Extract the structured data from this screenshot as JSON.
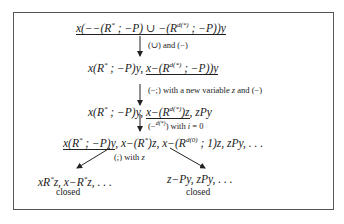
{
  "diagram": {
    "type": "tableau-derivation",
    "nodes": [
      {
        "id": "n1",
        "text": "x(−−(R* ; −P) ∪ −(R^d(*) ; −P))y",
        "underlined": "all"
      },
      {
        "id": "n2",
        "text": "x(R* ; −P)y, x−(R^d(*) ; −P))y",
        "underlined": "x−(R^d(*) ; −P))y"
      },
      {
        "id": "n3",
        "text": "x(R* ; −P)y, x−(R^d(*))z, zPy",
        "underlined": "x−(R^d(*))z"
      },
      {
        "id": "n4",
        "text": "x(R* ; −P)y, x−(R*)z, x−(R^d(0) ; 1)z, zPy, . . .",
        "underlined": "x(R* ; −P)y"
      },
      {
        "id": "n5",
        "text": "xR*z, x−R*z, . . .",
        "status": "closed"
      },
      {
        "id": "n6",
        "text": "z−Py, zPy, . . .",
        "status": "closed"
      }
    ],
    "edges": [
      {
        "from": "n1",
        "to": "n2",
        "label": "(∪) and (−)"
      },
      {
        "from": "n2",
        "to": "n3",
        "label": "(−;) with a new variable z and (−)"
      },
      {
        "from": "n3",
        "to": "n4",
        "label": "(−^d(*)) with i = 0"
      },
      {
        "from": "n4",
        "to": "n5",
        "label": "(;) with z"
      },
      {
        "from": "n4",
        "to": "n6",
        "label": "(;) with z"
      }
    ],
    "labels": {
      "e1": "(∪) and (−)",
      "e2_pre": "(−;) with a new variable ",
      "e2_var": "z",
      "e2_post": " and (−)",
      "e3_pre": "(−",
      "e3_sup": "d(*)",
      "e3_post": ") with ",
      "e3_var": "i",
      "e3_eq": " = 0",
      "e4_pre": "(;) with ",
      "e4_var": "z"
    },
    "closed_label": "closed"
  }
}
